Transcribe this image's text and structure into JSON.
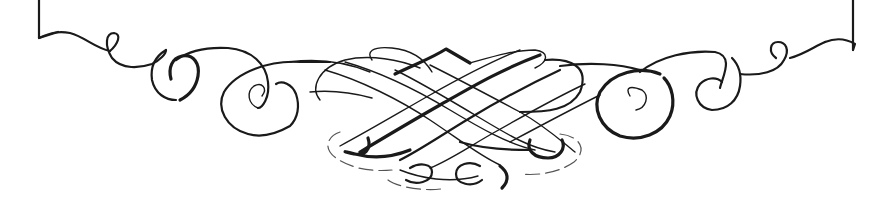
{
  "ornament": {
    "description": "calligraphic flourish divider",
    "ink_color": "#1a1a1a",
    "background_color": "#ffffff",
    "parts": [
      "left-frame-corner",
      "left-scrolls",
      "center-knot",
      "bottom-curl",
      "right-scrolls",
      "right-frame-corner"
    ]
  }
}
